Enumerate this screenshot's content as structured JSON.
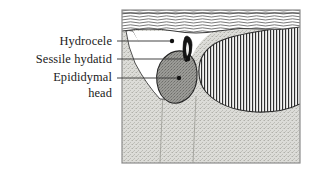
{
  "figure": {
    "frame": {
      "x": 122,
      "y": 10,
      "width": 178,
      "height": 153,
      "border_color": "#8c8c8c"
    },
    "colors": {
      "background": "#ffffff",
      "stipple_fill": "#dcdcd8",
      "stipple_dot": "#b4b4ae",
      "hydrocele_fill": "#ffffff",
      "epididymis_fill": "#9a9a96",
      "epididymis_stroke": "#2b2b2b",
      "hydatid_fill": "#141414",
      "testis_hatch": "#2e2e2e",
      "testis_fill": "#f2f2f0",
      "wall_line": "#4a4a4a",
      "leader_line": "#3a3a3a",
      "label_text": "#1a1a1a"
    },
    "regions": [
      {
        "name": "scrotal-wall",
        "label": "Scrotal wall",
        "pattern": "wavy-horizontal-lines"
      },
      {
        "name": "scrotal-sac",
        "label": "Scrotal sac",
        "pattern": "stipple"
      },
      {
        "name": "hydrocele-fluid",
        "label": "Hydrocele",
        "pattern": "blank-white"
      },
      {
        "name": "epididymal-head",
        "label": "Epididymal head",
        "pattern": "solid-gray-stipple"
      },
      {
        "name": "sessile-hydatid",
        "label": "Sessile hydatid",
        "pattern": "solid-black"
      },
      {
        "name": "testis",
        "label": "Testis",
        "pattern": "vertical-hatching"
      }
    ]
  },
  "labels": [
    {
      "id": "hydrocele",
      "text": "Hydrocele",
      "text_x": 112,
      "text_y": 45,
      "leader": {
        "x1": 117,
        "y1": 41,
        "x2": 170,
        "y2": 41
      },
      "dot": {
        "cx": 172,
        "cy": 41,
        "r": 2.2
      }
    },
    {
      "id": "sessile-hydatid",
      "text": "Sessile hydatid",
      "text_x": 112,
      "text_y": 63,
      "leader": {
        "x1": 117,
        "y1": 59,
        "x2": 186,
        "y2": 59
      },
      "dot": {
        "cx": 188,
        "cy": 59,
        "r": 2.2
      }
    },
    {
      "id": "epididymal-head",
      "text": "Epididymal",
      "text_x": 112,
      "text_y": 81,
      "leader": {
        "x1": 117,
        "y1": 78,
        "x2": 177,
        "y2": 78
      },
      "dot": {
        "cx": 179,
        "cy": 78,
        "r": 2.2
      }
    },
    {
      "id": "epididymal-head-line2",
      "text": "head",
      "text_x": 112,
      "text_y": 97,
      "leader": null,
      "dot": null
    }
  ]
}
